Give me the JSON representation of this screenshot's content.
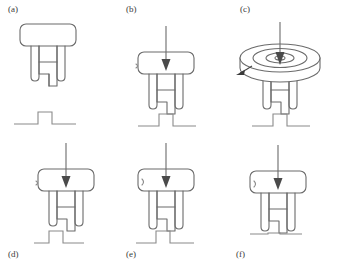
{
  "figure": {
    "stroke_color": "#6b6b6b",
    "dark_stroke_color": "#5a5a5a",
    "label_color": "#3a3a3a",
    "background_color": "#ffffff",
    "panel_count": 6
  },
  "panels": [
    {
      "id": "a",
      "label": "(a)",
      "label_position": "top-left",
      "has_force_arrow": false,
      "has_rotor": false,
      "has_body_marker": false,
      "terrain": "step-bump-detached",
      "description": "Robot standing free above a detached step-bump terrain profile"
    },
    {
      "id": "b",
      "label": "(b)",
      "label_position": "top-left",
      "has_force_arrow": true,
      "has_rotor": false,
      "has_body_marker": true,
      "terrain": "step-bump",
      "description": "Downward force arrow applied to body, robot over step bump"
    },
    {
      "id": "c",
      "label": "(c)",
      "label_position": "top-left",
      "has_force_arrow": true,
      "has_rotor": true,
      "has_body_marker": false,
      "terrain": "step-bump",
      "description": "Rotating concentric disc on top of body with downward force arrow and rotation direction arrow"
    },
    {
      "id": "d",
      "label": "(d)",
      "label_position": "bottom-left",
      "has_force_arrow": true,
      "has_rotor": false,
      "has_body_marker": true,
      "terrain": "step-up-left",
      "description": "Robot with downward arrow on step-up terrain, foot on raised edge"
    },
    {
      "id": "e",
      "label": "(e)",
      "label_position": "bottom-left",
      "has_force_arrow": true,
      "has_rotor": false,
      "has_body_marker": true,
      "terrain": "step-mid-raised",
      "description": "Robot with downward arrow, middle foot on raised plateau"
    },
    {
      "id": "f",
      "label": "(f)",
      "label_position": "bottom-left",
      "has_force_arrow": true,
      "has_rotor": false,
      "has_body_marker": true,
      "terrain": "step-notch",
      "description": "Robot with downward arrow settled on notched flat terrain"
    }
  ],
  "icons": {
    "force_arrow": "downward-arrow-icon",
    "rotation_arrow": "rotation-arrow-icon",
    "robot_body": "robot-body-icon",
    "robot_legs": "robot-legs-icon",
    "terrain_profile": "terrain-profile-icon",
    "rotor_disc": "rotor-disc-icon"
  }
}
